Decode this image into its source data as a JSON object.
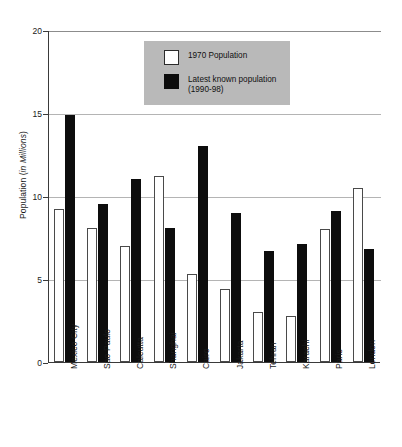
{
  "chart_data": {
    "type": "bar",
    "title": "",
    "xlabel": "",
    "ylabel": "Population (in Millions)",
    "ylim": [
      0,
      20
    ],
    "yticks": [
      0,
      5,
      10,
      15,
      20
    ],
    "ytick_labels": [
      "0",
      "5",
      "10",
      "15",
      "20"
    ],
    "grid": true,
    "legend_position": "top-center",
    "categories": [
      "Mexico City",
      "Sao Paulo",
      "Calcutta",
      "Shanghai",
      "Cairo",
      "Jakarta",
      "Tehran",
      "Karachi",
      "Paris",
      "London"
    ],
    "series": [
      {
        "name": "1970 Population",
        "color": "#ffffff",
        "values": [
          9.2,
          8.1,
          7.0,
          11.2,
          5.3,
          4.4,
          3.0,
          2.8,
          8.0,
          10.5
        ]
      },
      {
        "name": "Latest known population (1990-98)",
        "color": "#0d0d0d",
        "values": [
          14.9,
          9.5,
          11.0,
          8.1,
          13.0,
          9.0,
          6.7,
          7.1,
          9.1,
          6.8
        ]
      }
    ]
  },
  "legend": {
    "entries": [
      {
        "label": "1970 Population",
        "swatch": "white"
      },
      {
        "label": "Latest known population\n(1990-98)",
        "swatch": "black"
      }
    ]
  },
  "axes": {
    "y_title": "Population (in Millions)",
    "y_title_prefix": "Population (",
    "y_title_italic": "in Millions",
    "y_title_suffix": ")"
  }
}
